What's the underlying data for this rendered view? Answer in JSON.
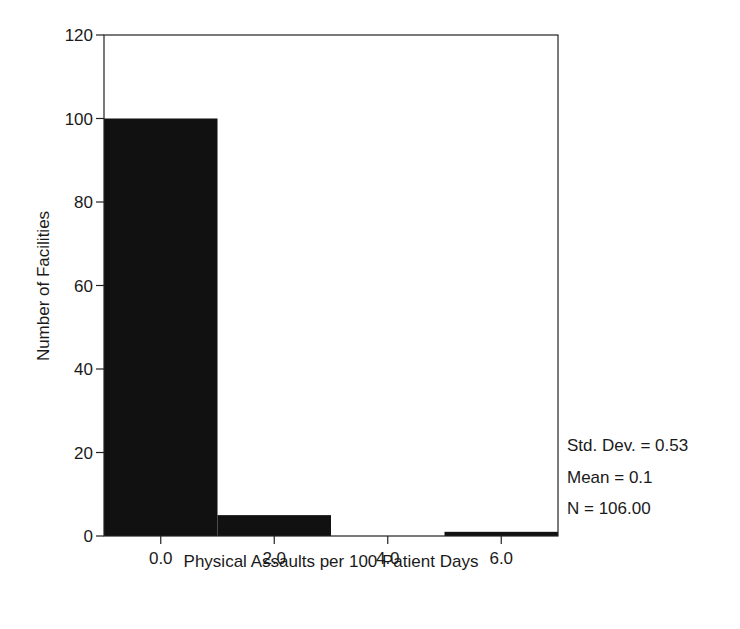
{
  "chart_data": {
    "type": "bar",
    "subtype": "histogram",
    "title": "",
    "xlabel": "Physical Assaults per 100 Patient Days",
    "ylabel": "Number of Facilities",
    "x_ticks": [
      "0.0",
      "2.0",
      "4.0",
      "6.0"
    ],
    "x_tick_values": [
      0,
      2,
      4,
      6
    ],
    "y_ticks": [
      "0",
      "20",
      "40",
      "60",
      "80",
      "100",
      "120"
    ],
    "ylim": [
      0,
      120
    ],
    "xlim": [
      -1,
      7
    ],
    "bin_width": 2.0,
    "bins": [
      {
        "center": 0.0,
        "start": -1.0,
        "end": 1.0,
        "count": 100
      },
      {
        "center": 2.0,
        "start": 1.0,
        "end": 3.0,
        "count": 5
      },
      {
        "center": 4.0,
        "start": 3.0,
        "end": 5.0,
        "count": 0
      },
      {
        "center": 6.0,
        "start": 5.0,
        "end": 7.0,
        "count": 1
      }
    ],
    "categories": [
      "0.0",
      "2.0",
      "4.0",
      "6.0"
    ],
    "values": [
      100,
      5,
      0,
      1
    ],
    "bar_color": "#111111",
    "grid": false,
    "statistics": {
      "std_dev": "Std. Dev. = 0.53",
      "mean": "Mean = 0.1",
      "n": "N = 106.00"
    }
  }
}
